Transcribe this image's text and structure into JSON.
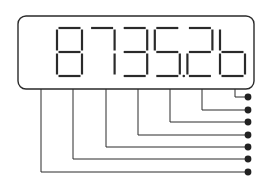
{
  "diagram": {
    "display_text": "87352b",
    "digits": [
      "8",
      "7",
      "3",
      "5",
      "2",
      "b"
    ],
    "decimal_point_after_index": 3,
    "leader_count": 7,
    "colors": {
      "stroke": "#2a2a2a",
      "segment": "#2a2a2a",
      "background": "#ffffff",
      "dot": "#222222"
    }
  }
}
